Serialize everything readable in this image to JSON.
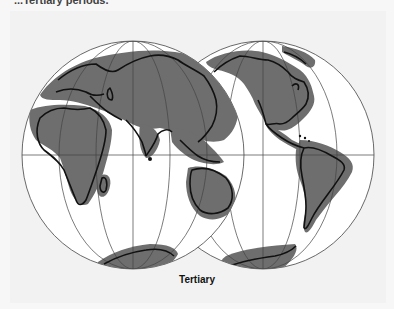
{
  "header": {
    "text": "...Tertiary periods."
  },
  "figure": {
    "caption": "Tertiary",
    "globes": [
      {
        "id": "eastern-hemisphere",
        "label": "Eurasia, Africa, Australia, Antarctica",
        "cx": 133,
        "cy": 155,
        "rx": 111,
        "ry": 114
      },
      {
        "id": "western-hemisphere",
        "label": "North America, South America, Antarctica",
        "cx": 263,
        "cy": 155,
        "rx": 111,
        "ry": 114
      }
    ],
    "colors": {
      "land_shading": "#6e6e6e",
      "globe_fill": "#ffffff",
      "graticule": "#444444",
      "coastline": "#111111",
      "background": "#f2f2f2"
    }
  }
}
